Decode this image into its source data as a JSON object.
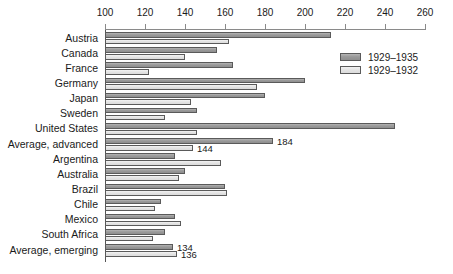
{
  "chart_data": {
    "type": "bar",
    "orientation": "horizontal",
    "title": "",
    "subtitle": "",
    "xlabel": "",
    "ylabel": "",
    "xlim": [
      100,
      260
    ],
    "xticks": [
      100,
      120,
      140,
      160,
      180,
      200,
      220,
      240,
      260
    ],
    "xtick_labels": [
      "100",
      "120",
      "140",
      "160",
      "180",
      "200",
      "220",
      "240",
      "260"
    ],
    "grid": false,
    "legend_position": "upper-right",
    "categories": [
      "Austria",
      "Canada",
      "France",
      "Germany",
      "Japan",
      "Sweden",
      "United States",
      "Average, advanced",
      "Argentina",
      "Australia",
      "Brazil",
      "Chile",
      "Mexico",
      "South Africa",
      "Average, emerging"
    ],
    "series": [
      {
        "name": "1929–1935",
        "color": "#9a9a9a",
        "values": [
          213,
          156,
          164,
          200,
          180,
          146,
          245,
          184,
          135,
          140,
          160,
          128,
          135,
          130,
          134
        ]
      },
      {
        "name": "1929–1932",
        "color": "#e2e2e2",
        "values": [
          162,
          140,
          122,
          176,
          143,
          130,
          146,
          144,
          158,
          137,
          161,
          125,
          138,
          124,
          136
        ]
      }
    ],
    "data_labels": {
      "Average, advanced": {
        "1929–1935": "184",
        "1929–1932": "144"
      },
      "Average, emerging": {
        "1929–1935": "134",
        "1929–1932": "136"
      }
    }
  },
  "legend": {
    "items": [
      {
        "label": "1929–1935",
        "swatch": "series-a"
      },
      {
        "label": "1929–1932",
        "swatch": "series-b"
      }
    ]
  },
  "colors": {
    "series_a": "#9a9a9a",
    "series_b": "#e2e2e2",
    "axis": "#8a8a8a",
    "bar_outline": "#5a5a5a",
    "text": "#1a1a1a",
    "background": "#ffffff"
  }
}
